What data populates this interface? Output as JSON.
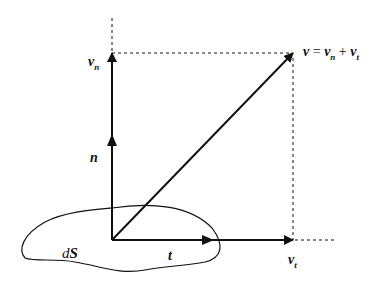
{
  "diagram": {
    "colors": {
      "stroke": "#111111",
      "background": "#ffffff"
    },
    "labels": {
      "v_n_main": "v",
      "v_n_sub": "n",
      "v_eq_v": "v",
      "v_eq_eq": " = ",
      "v_eq_vn": "v",
      "v_eq_vn_sub": "n",
      "v_eq_plus": " + ",
      "v_eq_vt": "v",
      "v_eq_vt_sub": "t",
      "n": "n",
      "t": "t",
      "dS_d": "d",
      "dS_S": "S",
      "v_t_main": "v",
      "v_t_sub": "t"
    },
    "elements": [
      {
        "id": "v_n",
        "type": "arrow",
        "from": [
          112,
          240
        ],
        "to": [
          112,
          53
        ]
      },
      {
        "id": "n",
        "type": "arrow-mid",
        "at": [
          112,
          140
        ]
      },
      {
        "id": "v",
        "type": "arrow",
        "from": [
          112,
          240
        ],
        "to": [
          293,
          53
        ]
      },
      {
        "id": "v_t",
        "type": "arrow",
        "from": [
          112,
          240
        ],
        "to": [
          293,
          240
        ]
      },
      {
        "id": "t",
        "type": "arrow-mid",
        "at": [
          210,
          240
        ]
      },
      {
        "id": "surface_dS",
        "type": "closed-curve"
      }
    ]
  }
}
